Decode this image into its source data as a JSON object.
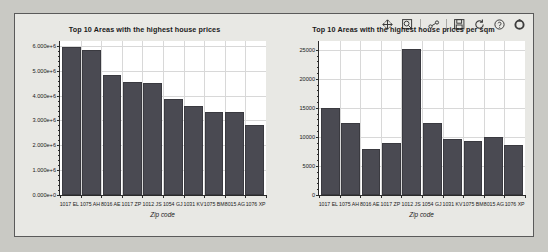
{
  "toolbar": {
    "items": [
      {
        "name": "pan-icon",
        "label": "Pan"
      },
      {
        "name": "zoom-icon",
        "label": "Zoom"
      },
      {
        "name": "curve-editor-icon",
        "label": "Curve editor"
      },
      {
        "name": "save-icon",
        "label": "Save"
      },
      {
        "name": "refresh-icon",
        "label": "Refresh"
      },
      {
        "name": "help-icon",
        "label": "Help"
      },
      {
        "name": "settings-icon",
        "label": "Settings"
      }
    ]
  },
  "chart_data": [
    {
      "type": "bar",
      "title": "Top 10 Areas with the highest house prices",
      "xlabel": "Zip code",
      "ylabel": "House prices in millions",
      "categories": [
        "1017 EL",
        "1075 AH",
        "8016 AE",
        "1017 ZP",
        "1012 JS",
        "1054 GJ",
        "1031 KV",
        "1075 BM",
        "8015 AG",
        "1076 XP"
      ],
      "values": [
        5950000,
        5830000,
        4850000,
        4550000,
        4500000,
        3880000,
        3570000,
        3350000,
        3350000,
        2800000
      ],
      "ylim": [
        0,
        6200000
      ],
      "yticks": [
        0,
        1000000,
        2000000,
        3000000,
        4000000,
        5000000,
        6000000
      ],
      "ytick_labels": [
        "0.000e+0",
        "1.000e+6",
        "2.000e+6",
        "3.000e+6",
        "4.000e+6",
        "5.000e+6",
        "6.000e+6"
      ],
      "grid": true,
      "legend": "none",
      "bar_color": "#4a4a52"
    },
    {
      "type": "bar",
      "title": "Top 10 Areas with the highest house prices per sqm",
      "xlabel": "Zip code",
      "ylabel": "House prices per sqm",
      "categories": [
        "1017 EL",
        "1075 AH",
        "8016 AE",
        "1017 ZP",
        "1012 JS",
        "1054 GJ",
        "1031 KV",
        "1075 BM",
        "8015 AG",
        "1076 XP"
      ],
      "values": [
        15000,
        12400,
        7900,
        9000,
        25200,
        12400,
        9700,
        9300,
        10000,
        8600
      ],
      "ylim": [
        0,
        26500
      ],
      "yticks": [
        0,
        5000,
        10000,
        15000,
        20000,
        25000
      ],
      "ytick_labels": [
        "0",
        "5000",
        "10000",
        "15000",
        "20000",
        "25000"
      ],
      "grid": true,
      "legend": "none",
      "bar_color": "#4a4a52"
    }
  ]
}
